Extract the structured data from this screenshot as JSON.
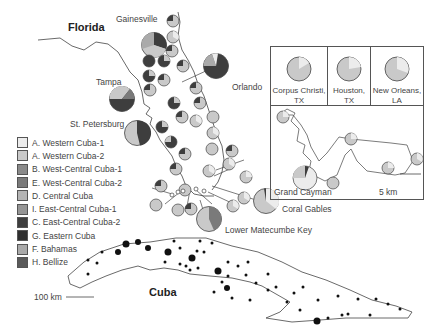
{
  "map": {
    "regions": {
      "florida": "Florida",
      "cuba": "Cuba"
    },
    "cities": [
      {
        "name": "Gainesville",
        "x": 116,
        "y": 16
      },
      {
        "name": "Orlando",
        "x": 311,
        "y": 83
      },
      {
        "name": "Tampa",
        "x": 96,
        "y": 79
      },
      {
        "name": "St. Petersburg",
        "x": 70,
        "y": 121
      },
      {
        "name": "Coral Gables",
        "x": 282,
        "y": 205
      },
      {
        "name": "Lower Matecumbe Key",
        "x": 225,
        "y": 226
      }
    ],
    "scale_main": "100 km",
    "scale_inset": "5 km"
  },
  "legend": {
    "items": [
      {
        "label": "A. Western Cuba-1",
        "color": "#ececec"
      },
      {
        "label": "A. Western Cuba-2",
        "color": "#c9c9c9"
      },
      {
        "label": "B. West-Central Cuba-1",
        "color": "#8a8a8a"
      },
      {
        "label": "E. West-Central Cuba-2",
        "color": "#7a7a7a"
      },
      {
        "label": "D. Central Cuba",
        "color": "#b4b4b4"
      },
      {
        "label": "I. East-Central Cuba-1",
        "color": "#959595"
      },
      {
        "label": "C. East-Central Cuba-2",
        "color": "#3e3e3e"
      },
      {
        "label": "G. Eastern Cuba",
        "color": "#2f2f2f"
      },
      {
        "label": "F. Bahamas",
        "color": "#aaaaaa"
      },
      {
        "label": "H. Bellize",
        "color": "#5a5a5a"
      }
    ]
  },
  "inset": {
    "locations": [
      {
        "label": "Corpus Christi, TX"
      },
      {
        "label": "Houston, TX"
      },
      {
        "label": "New Orleans, LA"
      }
    ],
    "island_label": "Grand Cayman"
  }
}
